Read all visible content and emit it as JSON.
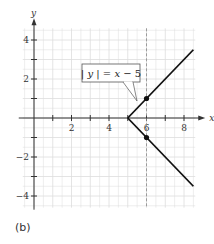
{
  "chart_data": {
    "type": "line",
    "title": "",
    "equation_label": "|y| = x − 5",
    "xlabel": "x",
    "ylabel": "y",
    "xlim": [
      -0.6,
      8.6
    ],
    "ylim": [
      -4.6,
      4.6
    ],
    "x_ticks": [
      1,
      2,
      3,
      4,
      5,
      6,
      7,
      8
    ],
    "x_tick_labels": [
      "2",
      "4",
      "6",
      "8"
    ],
    "x_tick_label_values": [
      2,
      4,
      6,
      8
    ],
    "y_ticks": [
      -4,
      -3,
      -2,
      -1,
      1,
      2,
      3,
      4
    ],
    "y_tick_labels": [
      "4",
      "2",
      "−2",
      "−4"
    ],
    "y_tick_label_values": [
      4,
      2,
      -2,
      -4
    ],
    "grid": true,
    "grid_step": 0.5,
    "series": [
      {
        "name": "upper branch y = x − 5",
        "x": [
          5,
          8.5
        ],
        "y": [
          0,
          3.5
        ]
      },
      {
        "name": "lower branch y = −(x − 5)",
        "x": [
          5,
          8.5
        ],
        "y": [
          0,
          -3.5
        ]
      }
    ],
    "points": [
      {
        "x": 6,
        "y": 1
      },
      {
        "x": 6,
        "y": -1
      }
    ],
    "vertical_dashed_line": {
      "x": 6
    },
    "legend": null
  },
  "figure": {
    "sub_label": "(b)",
    "line_color": "#111111",
    "grid_color": "#dddddd",
    "dash_color": "#888888"
  }
}
